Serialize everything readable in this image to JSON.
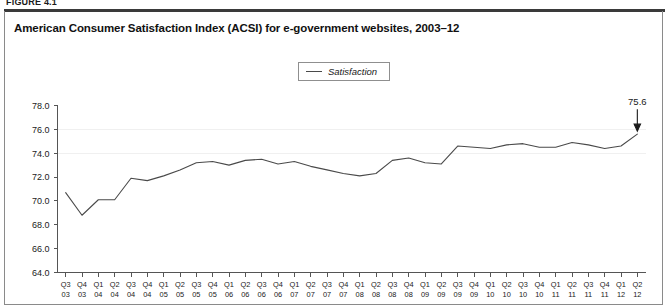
{
  "figure": {
    "label": "FIGURE 4.1",
    "title": "American Consumer Satisfaction Index (ACSI) for e-government websites, 2003–12"
  },
  "legend": {
    "position": "top-center",
    "entries": [
      {
        "label": "Satisfaction",
        "color": "#4a4a4a",
        "marker": "line"
      }
    ]
  },
  "annotation": {
    "value_label": "75.6",
    "icon": "down-arrow-icon"
  },
  "chart_data": {
    "type": "line",
    "title": "American Consumer Satisfaction Index (ACSI) for e-government websites, 2003–12",
    "xlabel": "",
    "ylabel": "",
    "ylim": [
      64.0,
      78.0
    ],
    "yticks": [
      "64.0",
      "66.0",
      "68.0",
      "70.0",
      "72.0",
      "74.0",
      "76.0",
      "78.0"
    ],
    "ytick_values": [
      64.0,
      66.0,
      68.0,
      70.0,
      72.0,
      74.0,
      76.0,
      78.0
    ],
    "grid": false,
    "legend_position": "top-center",
    "categories": [
      "Q3 03",
      "Q4 03",
      "Q1 04",
      "Q2 04",
      "Q3 04",
      "Q4 04",
      "Q1 05",
      "Q2 05",
      "Q3 05",
      "Q4 05",
      "Q1 06",
      "Q2 06",
      "Q3 06",
      "Q4 06",
      "Q1 07",
      "Q2 07",
      "Q3 07",
      "Q4 07",
      "Q1 08",
      "Q2 08",
      "Q3 08",
      "Q4 08",
      "Q1 09",
      "Q2 09",
      "Q3 09",
      "Q4 09",
      "Q1 10",
      "Q2 10",
      "Q3 10",
      "Q4 10",
      "Q1 11",
      "Q2 11",
      "Q3 11",
      "Q4 11",
      "Q1 12",
      "Q2 12"
    ],
    "categories_quarter": [
      "Q3",
      "Q4",
      "Q1",
      "Q2",
      "Q3",
      "Q4",
      "Q1",
      "Q2",
      "Q3",
      "Q4",
      "Q1",
      "Q2",
      "Q3",
      "Q4",
      "Q1",
      "Q2",
      "Q3",
      "Q4",
      "Q1",
      "Q2",
      "Q3",
      "Q4",
      "Q1",
      "Q2",
      "Q3",
      "Q4",
      "Q1",
      "Q2",
      "Q3",
      "Q4",
      "Q1",
      "Q2",
      "Q3",
      "Q4",
      "Q1",
      "Q2"
    ],
    "categories_year": [
      "03",
      "03",
      "04",
      "04",
      "04",
      "04",
      "05",
      "05",
      "05",
      "05",
      "06",
      "06",
      "06",
      "06",
      "07",
      "07",
      "07",
      "07",
      "08",
      "08",
      "08",
      "08",
      "09",
      "09",
      "09",
      "09",
      "10",
      "10",
      "10",
      "10",
      "11",
      "11",
      "11",
      "11",
      "12",
      "12"
    ],
    "series": [
      {
        "name": "Satisfaction",
        "color": "#4a4a4a",
        "values": [
          70.7,
          68.8,
          70.1,
          70.1,
          71.9,
          71.7,
          72.1,
          72.6,
          73.2,
          73.3,
          73.0,
          73.4,
          73.5,
          73.1,
          73.3,
          72.9,
          72.6,
          72.3,
          72.1,
          72.3,
          73.4,
          73.6,
          73.2,
          73.1,
          74.6,
          74.5,
          74.4,
          74.7,
          74.8,
          74.5,
          74.5,
          74.9,
          74.7,
          74.4,
          74.6,
          75.6
        ]
      }
    ]
  }
}
